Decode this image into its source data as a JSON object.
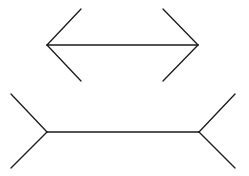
{
  "diagram": {
    "title": "",
    "background": "#ffffff",
    "stroke_color": "#1a1a1a",
    "figures": [
      {
        "name": "arrowheads-inward",
        "shaft": {
          "x1": 47,
          "y1": 45,
          "x2": 198,
          "y2": 45
        },
        "fins": [
          {
            "x1": 47,
            "y1": 45,
            "x2": 81,
            "y2": 9
          },
          {
            "x1": 47,
            "y1": 45,
            "x2": 81,
            "y2": 81
          },
          {
            "x1": 198,
            "y1": 45,
            "x2": 163,
            "y2": 9
          },
          {
            "x1": 198,
            "y1": 45,
            "x2": 163,
            "y2": 81
          }
        ]
      },
      {
        "name": "fins-outward",
        "shaft": {
          "x1": 47,
          "y1": 132,
          "x2": 199,
          "y2": 132
        },
        "fins": [
          {
            "x1": 47,
            "y1": 132,
            "x2": 11,
            "y2": 94
          },
          {
            "x1": 47,
            "y1": 132,
            "x2": 11,
            "y2": 168
          },
          {
            "x1": 199,
            "y1": 132,
            "x2": 235,
            "y2": 94
          },
          {
            "x1": 199,
            "y1": 132,
            "x2": 235,
            "y2": 168
          }
        ]
      }
    ]
  }
}
